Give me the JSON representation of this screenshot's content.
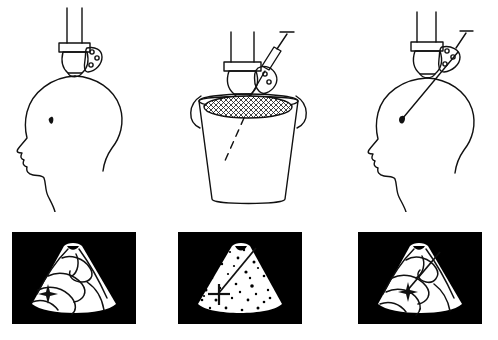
{
  "figure": {
    "background_color": "#ffffff",
    "ink_color": "#111111",
    "panel_background_color": "#000000",
    "scan_fill_color": "#ffffff",
    "columns": 3,
    "rows": 2,
    "width": 498,
    "height": 340,
    "has_visible_text": false
  },
  "top_row": {
    "row_name": "procedure-illustrations",
    "panels": [
      {
        "id": "panel-a",
        "label": "",
        "scene": "transducer-on-head",
        "description": "Ultrasound transducer with attached needle-guide bracket held against the vertex of a head shown in left lateral profile; a small dark lesion is marked inside the skull.",
        "elements": [
          {
            "name": "transducer-cable",
            "count": 2
          },
          {
            "name": "transducer-collar"
          },
          {
            "name": "transducer-body"
          },
          {
            "name": "transducer-footprint"
          },
          {
            "name": "needle-guide-bracket",
            "holes": 3
          },
          {
            "name": "head-profile"
          },
          {
            "name": "lesion-marker"
          }
        ],
        "needle_inserted": false,
        "syringe_attached": false
      },
      {
        "id": "panel-b",
        "label": "",
        "scene": "transducer-in-water-bath",
        "description": "Transducer with needle guide and mounted syringe dipped into a bucket of water; cross-hatching marks the water surface and a dashed line traces the projected needle path into the fluid.",
        "elements": [
          {
            "name": "transducer-cable",
            "count": 2
          },
          {
            "name": "transducer-collar"
          },
          {
            "name": "transducer-body"
          },
          {
            "name": "needle-guide-bracket",
            "holes": 2
          },
          {
            "name": "syringe-barrel"
          },
          {
            "name": "syringe-plunger-t-handle"
          },
          {
            "name": "needle-shaft"
          },
          {
            "name": "bucket"
          },
          {
            "name": "bucket-handle-left"
          },
          {
            "name": "bucket-handle-right"
          },
          {
            "name": "water-surface-hatch"
          },
          {
            "name": "projected-needle-path-dashed"
          }
        ],
        "needle_inserted": true,
        "syringe_attached": true
      },
      {
        "id": "panel-c",
        "label": "",
        "scene": "needle-inserted-into-head",
        "description": "Same transducer and guide placed on the head with the biopsy needle advanced through the guide into the brain, its tip resting on the dark lesion.",
        "elements": [
          {
            "name": "transducer-cable",
            "count": 2
          },
          {
            "name": "transducer-collar"
          },
          {
            "name": "transducer-body"
          },
          {
            "name": "transducer-footprint"
          },
          {
            "name": "needle-guide-bracket",
            "holes": 3
          },
          {
            "name": "syringe-plunger-t-handle"
          },
          {
            "name": "needle-shaft"
          },
          {
            "name": "head-profile"
          },
          {
            "name": "lesion-marker"
          }
        ],
        "needle_inserted": true,
        "syringe_attached": true
      }
    ]
  },
  "bottom_row": {
    "row_name": "ultrasound-scan-images",
    "panels": [
      {
        "id": "scan-a",
        "label": "",
        "scene": "brain-sector-scan",
        "description": "Black-framed sector ultrasound image of brain anatomy with curvilinear sulcal echoes; a four-pointed caliper cross marks the target lesion at the left of the sector.",
        "sector_content": "anatomy-lines",
        "has_needle_track": false,
        "markers": [
          {
            "name": "target-caliper-cross",
            "position": "left-mid"
          }
        ]
      },
      {
        "id": "scan-b",
        "label": "",
        "scene": "water-bath-sector-scan",
        "description": "Sector image acquired in the water bath showing speckle dots; a straight bright line shows the needle track running from the apex down to the caliper cross, confirming guide alignment.",
        "sector_content": "speckle-dots",
        "has_needle_track": true,
        "markers": [
          {
            "name": "needle-track-line",
            "position": "apex-to-center"
          },
          {
            "name": "target-caliper-cross",
            "position": "center-left"
          }
        ]
      },
      {
        "id": "scan-c",
        "label": "",
        "scene": "brain-sector-scan-with-needle",
        "description": "Brain sector image with the needle track crossing the anatomy and its tip reaching the caliper cross at the lesion.",
        "sector_content": "anatomy-lines",
        "has_needle_track": true,
        "markers": [
          {
            "name": "needle-track-line",
            "position": "upper-right-to-center"
          },
          {
            "name": "target-caliper-cross",
            "position": "center"
          }
        ]
      }
    ]
  }
}
